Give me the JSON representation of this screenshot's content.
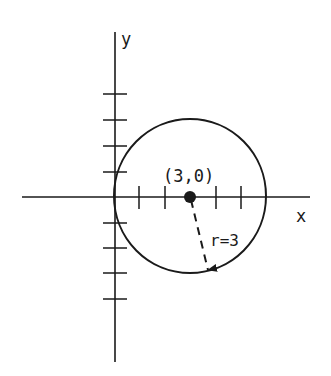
{
  "diagram": {
    "type": "circle-on-cartesian-plane",
    "axes": {
      "x_label": "x",
      "y_label": "y",
      "tick_spacing_units": 1
    },
    "circle": {
      "center_label": "(3,0)",
      "center": [
        3,
        0
      ],
      "radius": 3,
      "radius_label": "r=3"
    },
    "colors": {
      "ink": "#1a1a1a",
      "background": "#ffffff"
    }
  }
}
